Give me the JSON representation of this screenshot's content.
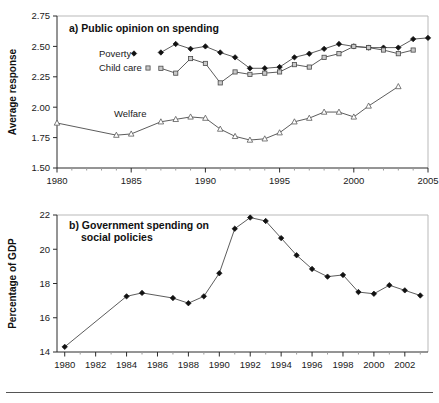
{
  "figure": {
    "footer_rule": true
  },
  "chart_data": [
    {
      "id": "panel-a",
      "type": "line",
      "title": "a) Public opinion on spending",
      "xlabel": "",
      "ylabel": "Average response",
      "xlim": [
        1980,
        2005
      ],
      "ylim": [
        1.5,
        2.75
      ],
      "yticks": [
        1.5,
        1.75,
        2.0,
        2.25,
        2.5,
        2.75
      ],
      "ytick_labels": [
        "1.50",
        "1.75",
        "2.00",
        "2.25",
        "2.50",
        "2.75"
      ],
      "xticks": [
        1980,
        1985,
        1990,
        1995,
        2000,
        2005
      ],
      "xtick_labels": [
        "1980",
        "1985",
        "1990",
        "1995",
        "2000",
        "2005"
      ],
      "x_minor_step": 1,
      "grid": false,
      "legend_position": "inline-left",
      "series": [
        {
          "name": "Poverty",
          "marker": "filled-diamond",
          "x": [
            1987,
            1988,
            1989,
            1990,
            1991,
            1992,
            1993,
            1994,
            1995,
            1996,
            1997,
            1998,
            1999,
            2000,
            2001,
            2002,
            2003,
            2004,
            2005
          ],
          "values": [
            2.45,
            2.52,
            2.48,
            2.5,
            2.45,
            2.41,
            2.32,
            2.32,
            2.33,
            2.41,
            2.44,
            2.48,
            2.52,
            2.5,
            2.49,
            2.49,
            2.49,
            2.56,
            2.57
          ]
        },
        {
          "name": "Child care",
          "marker": "open-square",
          "x": [
            1987,
            1988,
            1989,
            1990,
            1991,
            1992,
            1993,
            1994,
            1995,
            1996,
            1997,
            1998,
            1999,
            2000,
            2001,
            2002,
            2003,
            2004
          ],
          "values": [
            2.32,
            2.28,
            2.4,
            2.36,
            2.2,
            2.29,
            2.27,
            2.28,
            2.29,
            2.35,
            2.33,
            2.41,
            2.44,
            2.5,
            2.49,
            2.47,
            2.44,
            2.47
          ]
        },
        {
          "name": "Welfare",
          "marker": "open-triangle",
          "x": [
            1980,
            1984,
            1985,
            1987,
            1988,
            1989,
            1990,
            1991,
            1992,
            1993,
            1994,
            1995,
            1996,
            1997,
            1998,
            1999,
            2000,
            2001,
            2003
          ],
          "values": [
            1.87,
            1.77,
            1.78,
            1.88,
            1.9,
            1.92,
            1.91,
            1.82,
            1.76,
            1.73,
            1.74,
            1.79,
            1.88,
            1.91,
            1.96,
            1.96,
            1.92,
            2.01,
            2.17
          ]
        }
      ]
    },
    {
      "id": "panel-b",
      "type": "line",
      "title_line1": "b) Government spending on",
      "title_line2": "social policies",
      "title": "b) Government spending on social policies",
      "xlabel": "",
      "ylabel": "Percentage of GDP",
      "xlim": [
        1979.5,
        2003.5
      ],
      "ylim": [
        14,
        22
      ],
      "yticks": [
        14,
        16,
        18,
        20,
        22
      ],
      "ytick_labels": [
        "14",
        "16",
        "18",
        "20",
        "22"
      ],
      "xticks": [
        1980,
        1982,
        1984,
        1986,
        1988,
        1990,
        1992,
        1994,
        1996,
        1998,
        2000,
        2002
      ],
      "xtick_labels": [
        "1980",
        "1982",
        "1984",
        "1986",
        "1988",
        "1990",
        "1992",
        "1994",
        "1996",
        "1998",
        "2000",
        "2002"
      ],
      "x_minor_step": 1,
      "grid": false,
      "legend_position": "none",
      "series": [
        {
          "name": "Percentage of GDP",
          "marker": "filled-diamond",
          "x": [
            1980,
            1984,
            1985,
            1987,
            1988,
            1989,
            1990,
            1991,
            1992,
            1993,
            1994,
            1995,
            1996,
            1997,
            1998,
            1999,
            2000,
            2001,
            2002,
            2003
          ],
          "values": [
            14.3,
            17.25,
            17.45,
            17.15,
            16.85,
            17.25,
            18.6,
            21.2,
            21.85,
            21.65,
            20.65,
            19.65,
            18.85,
            18.4,
            18.5,
            17.5,
            17.4,
            17.9,
            17.6,
            17.3
          ]
        }
      ]
    }
  ]
}
